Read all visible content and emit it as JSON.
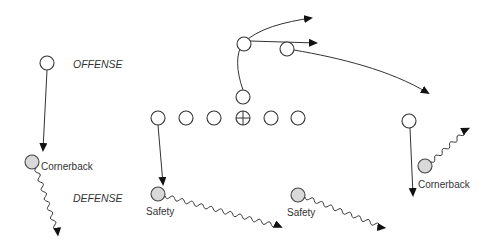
{
  "labels": {
    "offense": "OFFENSE",
    "defense": "DEFENSE"
  },
  "offense_players": [
    {
      "role": "left-receiver"
    },
    {
      "role": "left-tackle"
    },
    {
      "role": "left-guard"
    },
    {
      "role": "left-end"
    },
    {
      "role": "center",
      "marker": "crosshair"
    },
    {
      "role": "right-guard"
    },
    {
      "role": "right-tackle"
    },
    {
      "role": "running-back"
    },
    {
      "role": "quarterback"
    },
    {
      "role": "slot-receiver"
    },
    {
      "role": "right-receiver"
    }
  ],
  "defense_players": [
    {
      "label": "Cornerback",
      "side": "left"
    },
    {
      "label": "Safety",
      "side": "left"
    },
    {
      "label": "Safety",
      "side": "right"
    },
    {
      "label": "Cornerback",
      "side": "right"
    }
  ],
  "colors": {
    "offense_fill": "#ffffff",
    "defense_fill": "#d9d9d9",
    "line": "#333333"
  }
}
